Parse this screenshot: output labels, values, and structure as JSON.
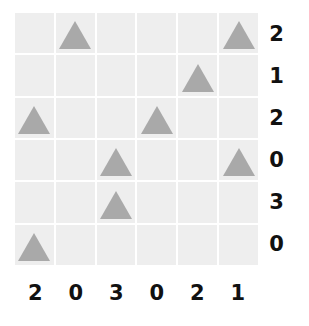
{
  "puzzle": {
    "rows": 6,
    "cols": 6,
    "colors": {
      "cell_background": "#eeeeee",
      "grid_line": "#ffffff",
      "triangle_fill": "#a9a9a9",
      "label_text": "#111111",
      "page_background": "#ffffff"
    },
    "shape_name": "triangle",
    "grid": [
      [
        0,
        1,
        0,
        0,
        0,
        1
      ],
      [
        0,
        0,
        0,
        0,
        1,
        0
      ],
      [
        1,
        0,
        0,
        1,
        0,
        0
      ],
      [
        0,
        0,
        1,
        0,
        0,
        1
      ],
      [
        0,
        0,
        1,
        0,
        0,
        0
      ],
      [
        1,
        0,
        0,
        0,
        0,
        0
      ]
    ],
    "row_labels": [
      "2",
      "1",
      "2",
      "0",
      "3",
      "0"
    ],
    "col_labels": [
      "2",
      "0",
      "3",
      "0",
      "2",
      "1"
    ]
  },
  "chart_data": {
    "type": "heatmap",
    "title": "",
    "xlabel": "",
    "ylabel": "",
    "categories": [
      "1",
      "2",
      "3",
      "4",
      "5",
      "6"
    ],
    "row_categories": [
      "1",
      "2",
      "3",
      "4",
      "5",
      "6"
    ],
    "values": [
      [
        0,
        1,
        0,
        0,
        0,
        1
      ],
      [
        0,
        0,
        0,
        0,
        1,
        0
      ],
      [
        1,
        0,
        0,
        1,
        0,
        0
      ],
      [
        0,
        0,
        1,
        0,
        0,
        1
      ],
      [
        0,
        0,
        1,
        0,
        0,
        0
      ],
      [
        1,
        0,
        0,
        0,
        0,
        0
      ]
    ],
    "row_totals": [
      2,
      1,
      2,
      0,
      3,
      0
    ],
    "col_totals": [
      2,
      0,
      3,
      0,
      2,
      1
    ],
    "legend": [],
    "grid": true,
    "marker": "triangle"
  }
}
